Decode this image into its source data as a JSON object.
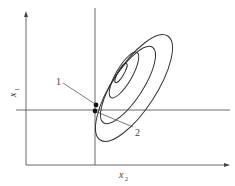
{
  "diagram": {
    "x_axis_label": "x",
    "x_axis_sub": "2",
    "y_axis_label": "x",
    "y_axis_sub": "1",
    "point_labels": [
      "1",
      "2"
    ],
    "line_color": "#333333",
    "contour_count": 4
  }
}
